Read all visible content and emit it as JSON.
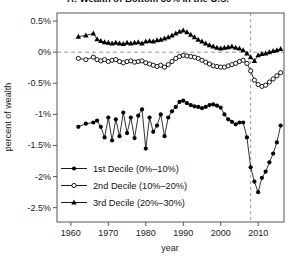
{
  "chart_data": {
    "type": "line",
    "title": "A: Wealth of Bottom 30% in the U.S.",
    "xlabel": "year",
    "ylabel": "percent of wealth",
    "xlim": [
      1956.3,
      2016.9
    ],
    "ylim": [
      -2.73,
      0.63
    ],
    "x_ticks": [
      1960,
      1970,
      1980,
      1990,
      2000,
      2010
    ],
    "y_ticks": [
      {
        "value": 0.5,
        "label": "0.5%"
      },
      {
        "value": 0.0,
        "label": "0%"
      },
      {
        "value": -0.5,
        "label": "-0.5%"
      },
      {
        "value": -1.0,
        "label": "-1%"
      },
      {
        "value": -1.5,
        "label": "-1.5%"
      },
      {
        "value": -2.0,
        "label": "-2%"
      },
      {
        "value": -2.5,
        "label": "-2.5%"
      }
    ],
    "grid": false,
    "legend_position": "bottom-left-inside",
    "reference_lines": {
      "horizontal_value": 0,
      "vertical_year": 2008,
      "style": "dashed"
    },
    "years": [
      1962,
      1964,
      1966,
      1967,
      1968,
      1969,
      1970,
      1971,
      1972,
      1973,
      1974,
      1975,
      1976,
      1977,
      1978,
      1979,
      1980,
      1981,
      1982,
      1983,
      1984,
      1985,
      1986,
      1987,
      1988,
      1989,
      1990,
      1991,
      1992,
      1993,
      1994,
      1995,
      1996,
      1997,
      1998,
      1999,
      2000,
      2001,
      2002,
      2003,
      2004,
      2005,
      2006,
      2007,
      2008,
      2009,
      2010,
      2011,
      2012,
      2013,
      2014,
      2015,
      2016
    ],
    "series": [
      {
        "name": "1st Decile (0%–10%)",
        "marker": "filled-circle",
        "color": "#000000",
        "values": [
          -1.2,
          -1.15,
          -1.13,
          -1.1,
          -1.2,
          -1.37,
          -1.05,
          -1.42,
          -1.08,
          -1.35,
          -0.97,
          -1.3,
          -1.05,
          -1.38,
          -1.02,
          -0.92,
          -1.55,
          -1.05,
          -1.28,
          -1.18,
          -1.0,
          -1.35,
          -1.05,
          -0.95,
          -0.88,
          -0.8,
          -0.78,
          -0.82,
          -0.85,
          -0.87,
          -0.88,
          -0.9,
          -0.88,
          -0.85,
          -0.84,
          -0.86,
          -0.89,
          -1.0,
          -1.08,
          -1.12,
          -1.16,
          -1.13,
          -1.13,
          -1.37,
          -1.85,
          -2.08,
          -2.25,
          -2.02,
          -1.92,
          -1.77,
          -1.63,
          -1.45,
          -1.18
        ]
      },
      {
        "name": "2nd Decile (10%–20%)",
        "marker": "open-circle",
        "color": "#000000",
        "values": [
          -0.1,
          -0.12,
          -0.08,
          -0.12,
          -0.14,
          -0.12,
          -0.15,
          -0.13,
          -0.12,
          -0.15,
          -0.17,
          -0.15,
          -0.14,
          -0.16,
          -0.15,
          -0.14,
          -0.17,
          -0.19,
          -0.21,
          -0.23,
          -0.21,
          -0.24,
          -0.2,
          -0.15,
          -0.1,
          -0.07,
          -0.05,
          -0.06,
          -0.07,
          -0.08,
          -0.1,
          -0.13,
          -0.16,
          -0.19,
          -0.22,
          -0.23,
          -0.24,
          -0.24,
          -0.22,
          -0.2,
          -0.18,
          -0.15,
          -0.13,
          -0.18,
          -0.3,
          -0.45,
          -0.52,
          -0.55,
          -0.53,
          -0.48,
          -0.43,
          -0.38,
          -0.33
        ]
      },
      {
        "name": "3rd Decile (20%–30%)",
        "marker": "filled-triangle",
        "color": "#000000",
        "values": [
          0.25,
          0.27,
          0.3,
          0.21,
          0.18,
          0.16,
          0.15,
          0.14,
          0.15,
          0.14,
          0.13,
          0.15,
          0.14,
          0.15,
          0.16,
          0.14,
          0.17,
          0.18,
          0.17,
          0.19,
          0.2,
          0.22,
          0.24,
          0.27,
          0.3,
          0.33,
          0.35,
          0.32,
          0.28,
          0.24,
          0.2,
          0.17,
          0.14,
          0.11,
          0.09,
          0.07,
          0.06,
          0.07,
          0.08,
          0.09,
          0.07,
          0.06,
          0.03,
          -0.02,
          -0.08,
          -0.14,
          -0.05,
          -0.03,
          -0.02,
          0.0,
          0.02,
          0.03,
          0.05
        ]
      }
    ],
    "colors": {
      "axis": "#555555",
      "dashed_reference": "#999999",
      "text": "#222222",
      "series": "#000000",
      "background": "#ffffff"
    }
  }
}
